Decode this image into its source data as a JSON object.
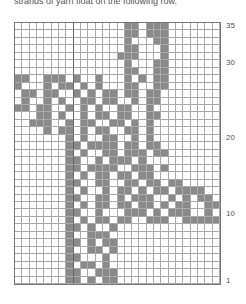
{
  "caption": "strands of yarn float on the following row.",
  "chart_data": {
    "type": "table",
    "columns": 28,
    "rows": 35,
    "row_labels": [
      {
        "row": 35,
        "label": "35"
      },
      {
        "row": 30,
        "label": "30"
      },
      {
        "row": 20,
        "label": "20"
      },
      {
        "row": 10,
        "label": "10"
      },
      {
        "row": 1,
        "label": "1"
      }
    ],
    "colors": {
      "contrast": "#8a8a8a",
      "background": "#ffffff",
      "grid": "#aaaaaa"
    },
    "pattern_top_to_bottom": [
      "...............##.###.......",
      "...............##.###.......",
      "...............#...##.......",
      "...............##...#.......",
      "..............###...#.......",
      "...............#...##.......",
      "...............##..##.......",
      "##..###.#..#...#.#.##.......",
      "#...#.##.#.#...##..##.......",
      ".##.##..#.#.##.##.##........",
      ".#..#.#..##.##..#.##........",
      "##.##..#.#.#..##..#.........",
      "...##.#..#.##.##..##........",
      "..###..#.##..##.#.#.........",
      "....#.##.#.##..##.#.........",
      ".......#.#..##..#.#.........",
      ".......##.####.##.##........",
      ".......#.#..##.###.##.......",
      ".......##..#.###.#..........",
      ".......##.####..###.#.......",
      ".......#.#.##.##.##.........",
      ".......##..##..##.##.##.....",
      ".......#.#..#.##.#.##.####..",
      ".......##..##.#.###..#.#.##.",
      ".......#.#.##.##.##.#.##..##",
      ".......##..#...###.#.###..#.",
      ".......#.#.##.##..###..#####",
      ".......##.#..#..............",
      ".......#..###...............",
      ".......##.#.##..............",
      ".......#..##.#..............",
      ".......##...#...............",
      ".......#.##.#...............",
      ".......##..###..............",
      ".......##.#.##.............."
    ]
  }
}
